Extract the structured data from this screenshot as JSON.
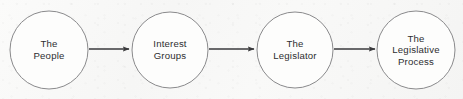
{
  "diagram": {
    "type": "flow-diagram",
    "canvas": {
      "width": 463,
      "height": 99
    },
    "style": {
      "background_color": "#f7f7f6",
      "node_stroke_color": "#8a8a8c",
      "node_fill_color": "#fdfdfc",
      "node_stroke_width": 1,
      "arrow_color": "#3a3a3c",
      "text_color": "#2e2e30",
      "node_radius": 39
    },
    "nodes": [
      {
        "id": "the-people",
        "label": "The People",
        "lines": [
          "The",
          "People"
        ],
        "cx": 49,
        "cy": 50,
        "r": 39
      },
      {
        "id": "interest-groups",
        "label": "Interest Groups",
        "lines": [
          "Interest",
          "Groups"
        ],
        "cx": 170,
        "cy": 50,
        "r": 38
      },
      {
        "id": "the-legislator",
        "label": "The Legislator",
        "lines": [
          "The",
          "Legislator"
        ],
        "cx": 295,
        "cy": 50,
        "r": 38
      },
      {
        "id": "the-legislative-process",
        "label": "The Legislative Process",
        "lines": [
          "The",
          "Legislative",
          "Process"
        ],
        "cx": 416,
        "cy": 50,
        "r": 39
      }
    ],
    "arrows": [
      {
        "id": "arrow-people-to-groups",
        "from": "the-people",
        "to": "interest-groups",
        "x1": 89,
        "x2": 129,
        "y": 49
      },
      {
        "id": "arrow-groups-to-legislator",
        "from": "interest-groups",
        "to": "the-legislator",
        "x1": 209,
        "x2": 254,
        "y": 49
      },
      {
        "id": "arrow-legislator-to-process",
        "from": "the-legislator",
        "to": "the-legislative-process",
        "x1": 334,
        "x2": 375,
        "y": 49
      }
    ]
  }
}
